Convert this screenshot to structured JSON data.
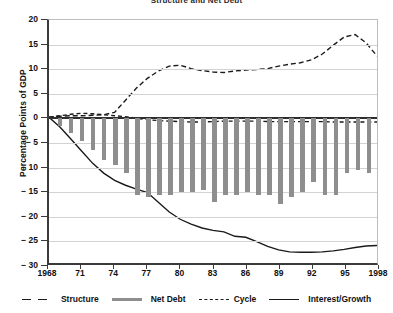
{
  "chart_data": {
    "type": "line",
    "title": "Structure and Net Debt",
    "xlabel": "",
    "ylabel": "Percentage Points of GDP",
    "ylim": [
      -30,
      20
    ],
    "xlim": [
      1968,
      1998
    ],
    "yticks": [
      "20",
      "15",
      "10",
      "5",
      "0",
      "− 5",
      "− 10",
      "− 15",
      "− 20",
      "− 25",
      "− 30"
    ],
    "ytick_values": [
      20,
      15,
      10,
      5,
      0,
      -5,
      -10,
      -15,
      -20,
      -25,
      -30
    ],
    "xticks": [
      "1968",
      "71",
      "74",
      "77",
      "80",
      "83",
      "86",
      "89",
      "92",
      "95",
      "1998"
    ],
    "xtick_values": [
      1968,
      1971,
      1974,
      1977,
      1980,
      1983,
      1986,
      1989,
      1992,
      1995,
      1998
    ],
    "grid": true,
    "legend_position": "bottom",
    "x": [
      1968,
      1969,
      1970,
      1971,
      1972,
      1973,
      1974,
      1975,
      1976,
      1977,
      1978,
      1979,
      1980,
      1981,
      1982,
      1983,
      1984,
      1985,
      1986,
      1987,
      1988,
      1989,
      1990,
      1991,
      1992,
      1993,
      1994,
      1995,
      1996,
      1997,
      1998
    ],
    "series": [
      {
        "name": "Structure",
        "style": "dashed-dotted",
        "color": "#1a1a1a",
        "values": [
          0.0,
          0.3,
          0.6,
          0.8,
          0.7,
          0.5,
          0.3,
          0.1,
          -0.2,
          -0.5,
          -0.7,
          -0.8,
          -0.9,
          -1.0,
          -1.0,
          -0.9,
          -0.8,
          -0.8,
          -0.8,
          -0.8,
          -0.9,
          -0.9,
          -0.9,
          -0.9,
          -0.9,
          -0.9,
          -1.0,
          -1.0,
          -1.0,
          -1.0,
          -1.0
        ]
      },
      {
        "name": "Net Debt",
        "style": "bars",
        "color": "#8e8e8e",
        "values": [
          0.0,
          -1.5,
          -3.0,
          -4.5,
          -6.5,
          -8.5,
          -9.5,
          -11.0,
          -15.5,
          -16.0,
          -15.5,
          -15.5,
          -15.0,
          -15.0,
          -14.5,
          -17.0,
          -15.5,
          -15.5,
          -15.0,
          -15.5,
          -15.5,
          -17.5,
          -16.0,
          -15.0,
          -13.0,
          -15.5,
          -15.5,
          -11.0,
          -10.5,
          -11.0,
          -13.0
        ]
      },
      {
        "name": "Cycle",
        "style": "dashed",
        "color": "#1a1a1a",
        "values": [
          0.0,
          0.2,
          0.3,
          0.3,
          0.4,
          0.5,
          1.0,
          3.5,
          6.0,
          8.0,
          9.5,
          10.5,
          10.7,
          10.0,
          9.6,
          9.3,
          9.2,
          9.5,
          9.7,
          9.8,
          10.0,
          10.5,
          10.9,
          11.2,
          11.8,
          13.0,
          14.8,
          16.5,
          17.0,
          15.3,
          12.6
        ]
      },
      {
        "name": "Interest/Growth",
        "style": "solid",
        "color": "#1a1a1a",
        "values": [
          0.0,
          -2.0,
          -4.5,
          -7.0,
          -9.5,
          -11.5,
          -13.0,
          -14.0,
          -14.8,
          -15.5,
          -17.5,
          -19.5,
          -21.0,
          -22.0,
          -22.8,
          -23.3,
          -23.6,
          -24.5,
          -24.7,
          -25.6,
          -26.6,
          -27.3,
          -27.7,
          -27.8,
          -27.8,
          -27.7,
          -27.5,
          -27.2,
          -26.8,
          -26.5,
          -26.4
        ]
      }
    ]
  },
  "legend": {
    "items": [
      {
        "label": "Structure"
      },
      {
        "label": "Net Debt"
      },
      {
        "label": "Cycle"
      },
      {
        "label": "Interest/Growth"
      }
    ]
  }
}
